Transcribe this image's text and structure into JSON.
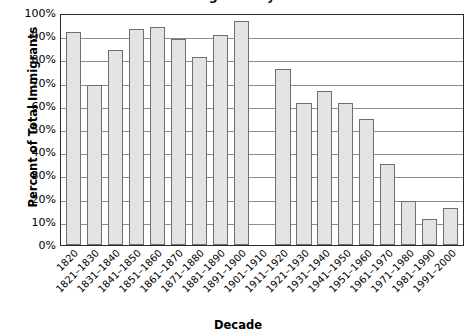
{
  "chart_data": {
    "type": "bar",
    "title": "Percent of Total Immigrants by Decade",
    "xlabel": "Decade",
    "ylabel": "Percent of Total Immigrants",
    "ylim": [
      0,
      100
    ],
    "ytick_labels": [
      "100%",
      "90%",
      "80%",
      "70%",
      "60%",
      "50%",
      "40%",
      "30%",
      "20%",
      "10%",
      "0%"
    ],
    "ytick_values": [
      100,
      90,
      80,
      70,
      60,
      50,
      40,
      30,
      20,
      10,
      0
    ],
    "grid": true,
    "legend": "none",
    "bar_fill_color": "#e3e3e3",
    "bar_border_color": "#6f6f6f",
    "axis_color": "#2b2b2b",
    "gridline_color": "#8d8d8d",
    "categories": [
      "1820",
      "1821–1830",
      "1831–1840",
      "1841–1850",
      "1851–1860",
      "1861–1870",
      "1871–1880",
      "1881–1890",
      "1891–1900",
      "1901–1910",
      "1911–1920",
      "1921–1930",
      "1931–1940",
      "1941–1950",
      "1951–1960",
      "1961–1970",
      "1971–1980",
      "1981–1990",
      "1991–2000"
    ],
    "values": [
      92,
      69,
      84,
      93,
      94,
      89,
      81,
      90.5,
      96.5,
      0,
      76,
      61,
      66.5,
      61,
      54.5,
      35,
      19,
      11,
      16
    ]
  }
}
